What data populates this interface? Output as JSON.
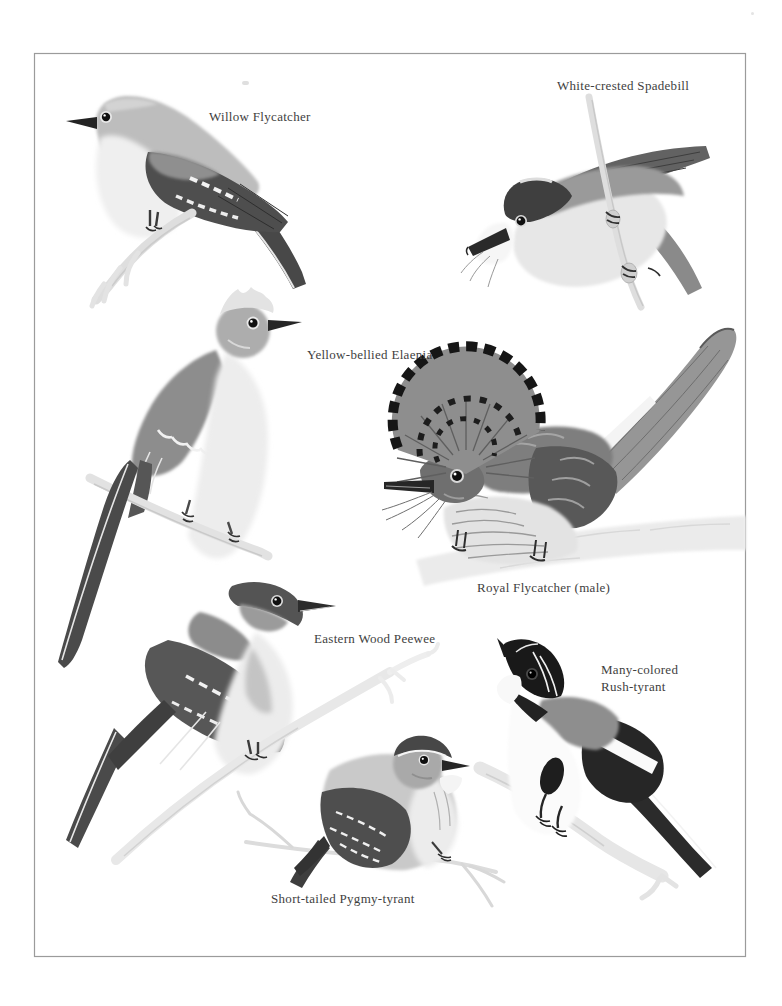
{
  "page": {
    "background_color": "#ffffff",
    "frame_border_color": "#9b9b9b",
    "text_color": "#3e3e3e"
  },
  "plate": {
    "birds": [
      {
        "id": "willow-flycatcher",
        "label": "Willow Flycatcher"
      },
      {
        "id": "white-crested-spadebill",
        "label": "White-crested Spadebill"
      },
      {
        "id": "yellow-bellied-elaenia",
        "label": "Yellow-bellied Elaenia"
      },
      {
        "id": "royal-flycatcher",
        "label": "Royal Flycatcher (male)"
      },
      {
        "id": "eastern-wood-peewee",
        "label": "Eastern Wood Peewee"
      },
      {
        "id": "many-colored-rush-tyrant",
        "label": "Many-colored Rush-tyrant",
        "label_lines": [
          "Many-colored",
          "Rush-tyrant"
        ]
      },
      {
        "id": "short-tailed-pygmy-tyrant",
        "label": "Short-tailed Pygmy-tyrant"
      }
    ],
    "palette": {
      "ink": "#1a1a1a",
      "dark_gray": "#4a4a4a",
      "mid_gray": "#8e8e8e",
      "light_gray": "#c9c9c9",
      "pale_wash": "#e9e9e9",
      "paper": "#ffffff"
    }
  }
}
